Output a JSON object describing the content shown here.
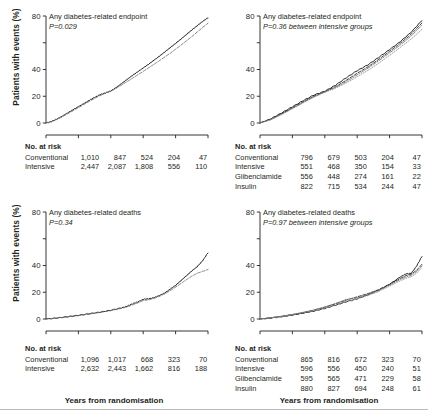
{
  "figure": {
    "xaxis_title": "Years from randomisation",
    "yaxis_title": "Patients with events (%)",
    "risk_heading": "No. at risk"
  },
  "chart_data": [
    {
      "id": "top-left",
      "type": "line",
      "title": "Any diabetes-related endpoint",
      "pvalue": "P=0.029",
      "xlabel": "Years from randomisation",
      "ylabel": "Patients with events (%)",
      "xlim": [
        0,
        15
      ],
      "ylim": [
        0,
        80
      ],
      "xticks": [
        0,
        3,
        6,
        9,
        12,
        15
      ],
      "xticklabels": [
        "",
        "",
        "",
        "",
        "",
        ""
      ],
      "yticks": [
        0,
        20,
        40,
        60,
        80
      ],
      "yticklabels": [
        "0",
        "20",
        "40",
        "",
        "80"
      ],
      "grid": false,
      "legend": "none",
      "series": [
        {
          "name": "Conventional",
          "style": "solid",
          "color": "#231f20",
          "x": [
            0,
            0.5,
            1,
            1.5,
            2,
            2.5,
            3,
            3.5,
            4,
            4.5,
            5,
            5.5,
            6,
            6.5,
            7,
            7.5,
            8,
            8.5,
            9,
            9.5,
            10,
            10.5,
            11,
            11.5,
            12,
            12.5,
            13,
            13.5,
            14,
            14.5,
            15
          ],
          "y": [
            0,
            1.2,
            3.0,
            5.2,
            7.6,
            10.0,
            12.3,
            14.6,
            17.0,
            19.2,
            21.2,
            22.6,
            24.0,
            26.6,
            29.6,
            32.6,
            35.6,
            38.4,
            41.2,
            44.0,
            47.0,
            50.0,
            53.2,
            56.4,
            59.6,
            62.8,
            66.2,
            69.6,
            72.8,
            76.0,
            78.8
          ]
        },
        {
          "name": "Intensive",
          "style": "dashed",
          "color": "#6f6f6f",
          "x": [
            0,
            0.5,
            1,
            1.5,
            2,
            2.5,
            3,
            3.5,
            4,
            4.5,
            5,
            5.5,
            6,
            6.5,
            7,
            7.5,
            8,
            8.5,
            9,
            9.5,
            10,
            10.5,
            11,
            11.5,
            12,
            12.5,
            13,
            13.5,
            14,
            14.5,
            15
          ],
          "y": [
            0,
            1.0,
            2.6,
            4.6,
            6.9,
            9.2,
            11.5,
            13.8,
            16.1,
            18.4,
            20.5,
            22.2,
            23.8,
            26.0,
            28.4,
            30.9,
            33.4,
            36.0,
            38.6,
            41.2,
            43.9,
            46.6,
            49.4,
            52.2,
            55.2,
            58.2,
            61.4,
            64.6,
            68.0,
            71.4,
            74.6
          ]
        }
      ],
      "risk_table": {
        "heading": "No. at risk",
        "rows": [
          {
            "group": "Conventional",
            "values": [
              "1,010",
              "847",
              "524",
              "204",
              "47"
            ]
          },
          {
            "group": "Intensive",
            "values": [
              "2,447",
              "2,087",
              "1,808",
              "556",
              "110"
            ]
          }
        ]
      }
    },
    {
      "id": "top-right",
      "type": "line",
      "title": "Any diabetes-related endpoint",
      "pvalue": "P=0.36 between intensive groups",
      "xlabel": "Years from randomisation",
      "ylabel": "Patients with events (%)",
      "xlim": [
        0,
        15
      ],
      "ylim": [
        0,
        80
      ],
      "xticks": [
        0,
        3,
        6,
        9,
        12,
        15
      ],
      "xticklabels": [
        "",
        "",
        "",
        "",
        "",
        ""
      ],
      "yticks": [
        0,
        20,
        40,
        60,
        80
      ],
      "yticklabels": [
        "0",
        "20",
        "40",
        "",
        "80"
      ],
      "grid": false,
      "legend": "none",
      "series": [
        {
          "name": "Conventional",
          "style": "solid",
          "color": "#231f20",
          "x": [
            0,
            1,
            2,
            3,
            4,
            5,
            6,
            7,
            8,
            9,
            10,
            11,
            12,
            13,
            14,
            15
          ],
          "y": [
            0,
            3.2,
            7.6,
            12.2,
            16.8,
            21.0,
            23.8,
            28.4,
            34.0,
            39.2,
            43.6,
            49.2,
            55.0,
            61.0,
            68.0,
            76.8
          ]
        },
        {
          "name": "Intensive",
          "style": "dashed",
          "color": "#231f20",
          "x": [
            0,
            1,
            2,
            3,
            4,
            5,
            6,
            7,
            8,
            9,
            10,
            11,
            12,
            13,
            14,
            15
          ],
          "y": [
            0,
            2.8,
            7.0,
            11.4,
            15.8,
            20.0,
            23.4,
            27.2,
            32.0,
            37.2,
            42.0,
            47.6,
            53.6,
            59.6,
            66.4,
            74.8
          ]
        },
        {
          "name": "Glibenclamide",
          "style": "dashdot",
          "color": "#6f6f6f",
          "x": [
            0,
            1,
            2,
            3,
            4,
            5,
            6,
            7,
            8,
            9,
            10,
            11,
            12,
            13,
            14,
            15
          ],
          "y": [
            0,
            2.6,
            6.6,
            11.0,
            15.4,
            19.6,
            23.2,
            26.6,
            31.0,
            36.0,
            41.0,
            46.6,
            52.4,
            58.4,
            65.0,
            73.2
          ]
        },
        {
          "name": "Insulin",
          "style": "dotted",
          "color": "#8c8c8c",
          "x": [
            0,
            1,
            2,
            3,
            4,
            5,
            6,
            7,
            8,
            9,
            10,
            11,
            12,
            13,
            14,
            15
          ],
          "y": [
            0,
            2.4,
            6.2,
            10.6,
            15.0,
            19.4,
            23.0,
            26.0,
            30.0,
            34.6,
            39.4,
            44.8,
            50.6,
            56.6,
            62.8,
            70.0
          ]
        }
      ],
      "risk_table": {
        "heading": "No. at risk",
        "rows": [
          {
            "group": "Conventional",
            "values": [
              "796",
              "679",
              "503",
              "204",
              "47"
            ]
          },
          {
            "group": "Intensive",
            "values": [
              "551",
              "468",
              "350",
              "154",
              "33"
            ]
          },
          {
            "group": "Glibenclamide",
            "values": [
              "556",
              "448",
              "274",
              "161",
              "22"
            ]
          },
          {
            "group": "Insulin",
            "values": [
              "822",
              "715",
              "534",
              "244",
              "47"
            ]
          }
        ]
      }
    },
    {
      "id": "bottom-left",
      "type": "line",
      "title": "Any diabetes-related deaths",
      "pvalue": "P=0.34",
      "xlabel": "Years from randomisation",
      "ylabel": "Patients with events (%)",
      "xlim": [
        0,
        15
      ],
      "ylim": [
        0,
        80
      ],
      "xticks": [
        0,
        3,
        6,
        9,
        12,
        15
      ],
      "xticklabels": [
        "0",
        "3",
        "6",
        "9",
        "12",
        "15"
      ],
      "yticks": [
        0,
        20,
        40,
        60,
        80
      ],
      "yticklabels": [
        "0",
        "20",
        "40",
        "",
        "80"
      ],
      "grid": false,
      "legend": "none",
      "series": [
        {
          "name": "Conventional",
          "style": "solid",
          "color": "#231f20",
          "x": [
            0,
            1,
            2,
            3,
            4,
            5,
            6,
            7,
            7.5,
            8,
            8.5,
            9,
            9.5,
            10,
            10.5,
            11,
            11.5,
            12,
            12.5,
            13,
            13.5,
            14,
            14.5,
            15
          ],
          "y": [
            0,
            0.8,
            1.8,
            2.8,
            4.0,
            5.2,
            6.6,
            8.4,
            9.6,
            11.4,
            12.8,
            14.8,
            15.2,
            16.0,
            17.6,
            19.6,
            22.4,
            25.2,
            28.8,
            32.4,
            36.0,
            39.2,
            43.6,
            49.6
          ]
        },
        {
          "name": "Intensive",
          "style": "dashed",
          "color": "#6f6f6f",
          "x": [
            0,
            1,
            2,
            3,
            4,
            5,
            6,
            7,
            7.5,
            8,
            8.5,
            9,
            9.5,
            10,
            10.5,
            11,
            11.5,
            12,
            12.5,
            13,
            13.5,
            14,
            14.5,
            15
          ],
          "y": [
            0,
            0.7,
            1.6,
            2.6,
            3.7,
            4.9,
            6.3,
            8.0,
            9.0,
            10.6,
            12.0,
            13.8,
            14.4,
            15.4,
            17.0,
            18.8,
            21.2,
            23.8,
            26.6,
            29.4,
            32.0,
            34.2,
            35.6,
            37.0
          ]
        }
      ],
      "risk_table": {
        "heading": "No. at risk",
        "rows": [
          {
            "group": "Conventional",
            "values": [
              "1,096",
              "1,017",
              "668",
              "323",
              "70"
            ]
          },
          {
            "group": "Intensive",
            "values": [
              "2,632",
              "2,443",
              "1,662",
              "816",
              "188"
            ]
          }
        ]
      }
    },
    {
      "id": "bottom-right",
      "type": "line",
      "title": "Any diabetes-related deaths",
      "pvalue": "P=0.97 between intensive groups",
      "xlabel": "Years from randomisation",
      "ylabel": "Patients with events (%)",
      "xlim": [
        0,
        15
      ],
      "ylim": [
        0,
        80
      ],
      "xticks": [
        0,
        3,
        6,
        9,
        12,
        15
      ],
      "xticklabels": [
        "0",
        "3",
        "6",
        "9",
        "12",
        "15"
      ],
      "yticks": [
        0,
        20,
        40,
        60,
        80
      ],
      "yticklabels": [
        "0",
        "20",
        "40",
        "",
        "80"
      ],
      "grid": false,
      "legend": "none",
      "series": [
        {
          "name": "Conventional",
          "style": "solid",
          "color": "#231f20",
          "x": [
            0,
            1,
            2,
            3,
            4,
            5,
            6,
            7,
            8,
            9,
            10,
            11,
            12,
            13,
            13.5,
            14,
            14.5,
            15
          ],
          "y": [
            0,
            0.8,
            1.8,
            3.0,
            4.4,
            6.0,
            8.0,
            10.4,
            13.0,
            15.2,
            18.2,
            21.6,
            26.0,
            31.6,
            33.8,
            34.2,
            39.6,
            47.0
          ]
        },
        {
          "name": "Intensive",
          "style": "dashed",
          "color": "#231f20",
          "x": [
            0,
            1,
            2,
            3,
            4,
            5,
            6,
            7,
            8,
            9,
            10,
            11,
            12,
            13,
            13.5,
            14,
            14.5,
            15
          ],
          "y": [
            0,
            0.9,
            2.0,
            3.3,
            4.8,
            6.6,
            8.8,
            11.4,
            14.2,
            16.6,
            19.0,
            22.0,
            26.0,
            30.4,
            32.4,
            33.6,
            36.4,
            41.0
          ]
        },
        {
          "name": "Glibenclamide",
          "style": "dashdot",
          "color": "#6f6f6f",
          "x": [
            0,
            1,
            2,
            3,
            4,
            5,
            6,
            7,
            8,
            9,
            10,
            11,
            12,
            13,
            13.5,
            14,
            14.5,
            15
          ],
          "y": [
            0,
            0.9,
            2.1,
            3.4,
            5.0,
            6.8,
            9.0,
            11.6,
            14.6,
            16.0,
            18.4,
            21.4,
            25.4,
            29.6,
            31.4,
            32.6,
            35.4,
            39.6
          ]
        },
        {
          "name": "Insulin",
          "style": "dotted",
          "color": "#8c8c8c",
          "x": [
            0,
            1,
            2,
            3,
            4,
            5,
            6,
            7,
            8,
            9,
            10,
            11,
            12,
            13,
            13.5,
            14,
            14.5,
            15
          ],
          "y": [
            0,
            0.8,
            1.9,
            3.1,
            4.6,
            6.2,
            8.2,
            10.6,
            13.2,
            15.0,
            17.6,
            20.6,
            24.6,
            28.6,
            30.4,
            31.6,
            34.2,
            38.4
          ]
        }
      ],
      "risk_table": {
        "heading": "No. at risk",
        "rows": [
          {
            "group": "Conventional",
            "values": [
              "865",
              "816",
              "672",
              "323",
              "70"
            ]
          },
          {
            "group": "Intensive",
            "values": [
              "596",
              "556",
              "450",
              "240",
              "51"
            ]
          },
          {
            "group": "Glibenclamide",
            "values": [
              "595",
              "565",
              "471",
              "229",
              "58"
            ]
          },
          {
            "group": "Insulin",
            "values": [
              "880",
              "827",
              "694",
              "248",
              "61"
            ]
          }
        ]
      }
    }
  ]
}
